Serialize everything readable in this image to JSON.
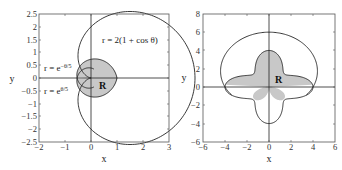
{
  "chart_data": [
    {
      "type": "line",
      "title": "",
      "xlabel": "x",
      "ylabel": "y",
      "xlim": [
        -2,
        3
      ],
      "ylim": [
        -2.5,
        2.5
      ],
      "xticks": [
        "−2",
        "−1",
        "0",
        "1",
        "2",
        "3"
      ],
      "yticks": [
        "2.5",
        "2",
        "1.5",
        "1",
        "0.5",
        "0",
        "−0.5",
        "−1",
        "−1.5",
        "−2",
        "−2.5"
      ],
      "grid": false,
      "series": [
        {
          "name": "r = 2(1 + cos θ)",
          "polar": "2*(1+cos(t))"
        },
        {
          "name": "r = e^(−θ/5)",
          "polar": "exp(-t/5)"
        },
        {
          "name": "r = e^(θ/5)",
          "polar": "exp(t/5)"
        }
      ],
      "annotations": [
        "r = 2(1 + cos θ)",
        "r = e−θ/5",
        "r = eθ/5",
        "R"
      ],
      "shaded_region": "R"
    },
    {
      "type": "line",
      "title": "",
      "xlabel": "x",
      "ylabel": "y",
      "xlim": [
        -6,
        6
      ],
      "ylim": [
        -6,
        8
      ],
      "xticks": [
        "−6",
        "−4",
        "−2",
        "0",
        "2",
        "4",
        "6"
      ],
      "yticks": [
        "8",
        "6",
        "4",
        "2",
        "0",
        "−2",
        "−4",
        "−6"
      ],
      "grid": false,
      "series": [
        {
          "name": "outer curve",
          "note": "top at y=6, crosses x-axis near ±4"
        },
        {
          "name": "four-lobed curve",
          "note": "lobes reach (0,4), (0,−4), (±4,0)"
        }
      ],
      "annotations": [
        "R"
      ],
      "shaded_region": "R"
    }
  ],
  "labels": {
    "left": {
      "x": "x",
      "y": "y",
      "ann1": "r = 2(1 + cos θ)",
      "ann2_base": "r = e",
      "ann2_exp": "−θ/5",
      "ann3_base": "r = e",
      "ann3_exp": "θ/5",
      "region": "R"
    },
    "right": {
      "x": "x",
      "y": "y",
      "region": "R"
    }
  },
  "ticks": {
    "left_x": [
      "−2",
      "−1",
      "0",
      "1",
      "2",
      "3"
    ],
    "left_y": [
      "2.5",
      "2",
      "1.5",
      "1",
      "0.5",
      "0",
      "−0.5",
      "−1",
      "−1.5",
      "−2",
      "−2.5"
    ],
    "right_x": [
      "−6",
      "−4",
      "−2",
      "0",
      "2",
      "4",
      "6"
    ],
    "right_y": [
      "8",
      "6",
      "4",
      "2",
      "0",
      "−2",
      "−4",
      "−6"
    ]
  },
  "colors": {
    "line": "#222222",
    "shade": "#c8c8c8",
    "frame": "#555555"
  }
}
